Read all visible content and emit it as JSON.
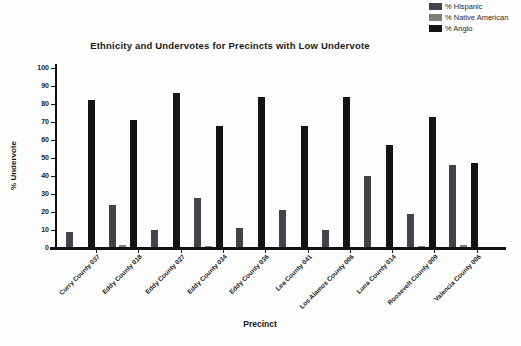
{
  "chart_data": {
    "type": "bar",
    "title": "Ethnicity and Undervotes for Precincts with Low Undervote",
    "xlabel": "Precinct",
    "ylabel": "% Undervote",
    "ylim": [
      0,
      100
    ],
    "yticks": [
      0,
      10,
      20,
      30,
      40,
      50,
      60,
      70,
      80,
      90,
      100
    ],
    "grid": false,
    "legend_position": "top-right",
    "categories": [
      "Curry County 037",
      "Eddy County 018",
      "Eddy County 027",
      "Eddy County 034",
      "Eddy County 036",
      "Lea County 041",
      "Los Alamos County 006",
      "Luna County 014",
      "Roosevelt County 009",
      "Valencia County 006"
    ],
    "series": [
      {
        "name": "% Hispanic",
        "color": "#45424b",
        "values": [
          9,
          24,
          10,
          28,
          11,
          21,
          10,
          40,
          19,
          46
        ]
      },
      {
        "name": "% Native American",
        "color": "#7d8178",
        "values": [
          0,
          1.5,
          0,
          1,
          0.5,
          0,
          0.5,
          0,
          1,
          1.5
        ]
      },
      {
        "name": "% Anglo",
        "color": "#141414",
        "values": [
          82,
          71,
          86,
          68,
          84,
          68,
          84,
          57,
          73,
          47
        ]
      }
    ]
  }
}
